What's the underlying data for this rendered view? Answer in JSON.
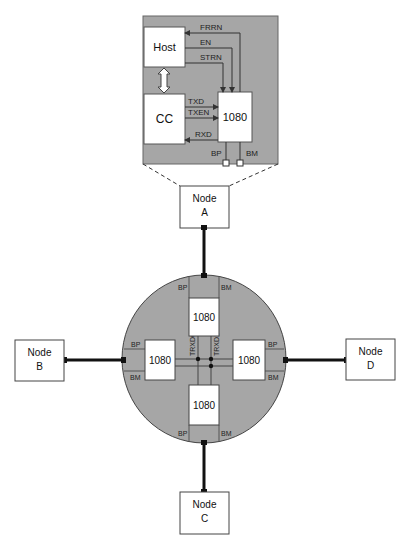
{
  "diagram": {
    "detail_panel": {
      "host_label": "Host",
      "cc_label": "CC",
      "chip_label": "1080",
      "signals": {
        "frrn": "FRRN",
        "en": "EN",
        "strn": "STRN",
        "txd": "TXD",
        "txen": "TXEN",
        "rxd": "RXD",
        "bp": "BP",
        "bm": "BM"
      }
    },
    "nodes": {
      "a": {
        "line1": "Node",
        "line2": "A"
      },
      "b": {
        "line1": "Node",
        "line2": "B"
      },
      "c": {
        "line1": "Node",
        "line2": "C"
      },
      "d": {
        "line1": "Node",
        "line2": "D"
      }
    },
    "hub": {
      "chips": {
        "top": "1080",
        "left": "1080",
        "right": "1080",
        "bottom": "1080"
      },
      "ports": {
        "bp": "BP",
        "bm": "BM"
      },
      "bus_labels": {
        "trxd0": "TRXD0",
        "trxd1": "TRXD1"
      }
    },
    "colors": {
      "panel_fill": "#a6a6a6",
      "box_fill": "#ffffff",
      "line": "#333333",
      "cable": "#111111"
    }
  }
}
